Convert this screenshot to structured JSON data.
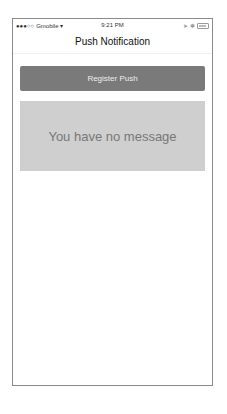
{
  "status_bar": {
    "signal": "●●●○○",
    "carrier": "Gmobile",
    "wifi": "wifi-icon",
    "time": "9:21 PM",
    "icons": [
      "location-icon",
      "bluetooth-icon",
      "battery-icon"
    ]
  },
  "nav": {
    "title": "Push Notification"
  },
  "register_button": {
    "label": "Register Push",
    "color": "#7a7a7a"
  },
  "message": {
    "text": "You have no message",
    "background": "#cfcfcf"
  }
}
